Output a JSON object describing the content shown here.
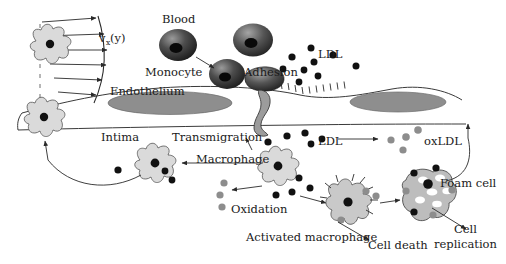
{
  "figure": {
    "background": "#ffffff",
    "ink": "#1a1a1a"
  },
  "labels": {
    "velocity": "v",
    "velocity_sub": "x",
    "velocity_arg": "(y)",
    "blood": "Blood",
    "monocyte": "Monocyte",
    "adhesion": "Adhesion",
    "ldl_top": "LDL",
    "endothelium": "Endothelium",
    "intima": "Intima",
    "transmigration": "Transmigration",
    "ldl_mid": "LDL",
    "oxldl": "oxLDL",
    "macrophage": "Macrophage",
    "oxidation": "Oxidation",
    "activated_macrophage": "Activated macrophage",
    "cell_death": "Cell death",
    "foam_cell": "Foam cell",
    "cell_replication_l1": "Cell",
    "cell_replication_l2": "replication"
  },
  "colors": {
    "ink": "#1a1a1a",
    "line": "#3a3a3a",
    "cell_fill": "#d8d8d8",
    "cell_stroke": "#4a4a4a",
    "nucleus_ellipse": "#8e8e8e",
    "ldl_particle": "#111111",
    "oxldl_particle": "#8a8a8a",
    "foam_fill": "#bdbdbd",
    "lipid_droplet": "#ffffff",
    "monocyte_dark": "#2b2b2b",
    "monocyte_mid": "#6d6d6d",
    "monocyte_core": "#0a0a0a"
  },
  "particles": {
    "ldl_top_count": 9,
    "ldl_mid_count": 6,
    "oxldl_count": 5,
    "note_ldl": "black filled circles",
    "note_oxldl": "gray filled circles"
  },
  "velocity_profile": {
    "arrow_count": 6,
    "shape": "parabolic",
    "centerline": "dashed"
  },
  "cells": {
    "smooth_muscle_count": 2,
    "monocyte_count": 4,
    "macrophage_count": 2,
    "activated_macrophage_count": 1,
    "foam_cell_count": 1,
    "endothelial_nuclei": 2
  }
}
